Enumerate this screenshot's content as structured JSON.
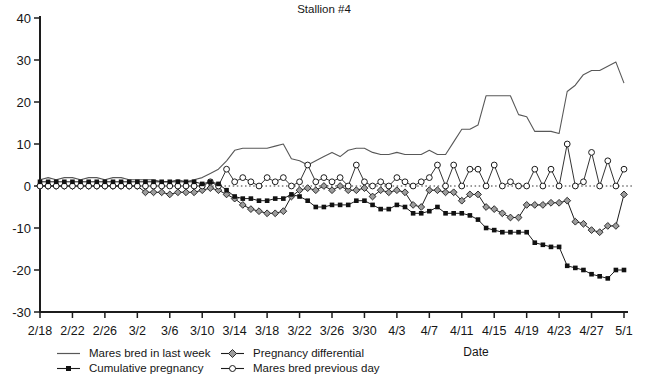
{
  "title": "Stallion #4",
  "axes": {
    "x_label": "Date",
    "y_ticks": [
      "40",
      "30",
      "20",
      "10",
      "0",
      "-10",
      "-20",
      "-30"
    ],
    "y_min": -30,
    "y_max": 40
  },
  "legend": [
    {
      "label": "Mares bred in last week",
      "marker": "line"
    },
    {
      "label": "Cumulative pregnancy",
      "marker": "square"
    },
    {
      "label": "Pregnancy differential",
      "marker": "diamond"
    },
    {
      "label": "Mares bred previous day",
      "marker": "circle"
    }
  ],
  "colors": {
    "axis": "#1c1c1c",
    "text": "#161616",
    "thin_line_series": "#585858",
    "marker_line": "#1c1c1c",
    "square_fill": "#111111",
    "diamond_fill": "#9c9c9c",
    "circle_fill": "#ffffff",
    "zero_line": "#333333",
    "background": "#ffffff"
  },
  "chart_data": {
    "type": "line",
    "title": "Stallion #4",
    "xlabel": "Date",
    "ylabel": "",
    "ylim": [
      -30,
      40
    ],
    "x_tick_every": 4,
    "grid": false,
    "zero_line": "dotted",
    "legend_position": "bottom",
    "x": [
      "2/18",
      "2/19",
      "2/20",
      "2/21",
      "2/22",
      "2/23",
      "2/24",
      "2/25",
      "2/26",
      "2/27",
      "2/28",
      "3/1",
      "3/2",
      "3/3",
      "3/4",
      "3/5",
      "3/6",
      "3/7",
      "3/8",
      "3/9",
      "3/10",
      "3/11",
      "3/12",
      "3/13",
      "3/14",
      "3/15",
      "3/16",
      "3/17",
      "3/18",
      "3/19",
      "3/20",
      "3/21",
      "3/22",
      "3/23",
      "3/24",
      "3/25",
      "3/26",
      "3/27",
      "3/28",
      "3/29",
      "3/30",
      "3/31",
      "4/1",
      "4/2",
      "4/3",
      "4/4",
      "4/5",
      "4/6",
      "4/7",
      "4/8",
      "4/9",
      "4/10",
      "4/11",
      "4/12",
      "4/13",
      "4/14",
      "4/15",
      "4/16",
      "4/17",
      "4/18",
      "4/19",
      "4/20",
      "4/21",
      "4/22",
      "4/23",
      "4/24",
      "4/25",
      "4/26",
      "4/27",
      "4/28",
      "4/29",
      "4/30",
      "5/1"
    ],
    "series": [
      {
        "name": "Mares bred in last week",
        "marker": "none",
        "values": [
          1.5,
          2,
          1.5,
          2,
          2,
          1.5,
          2,
          2,
          1.5,
          2,
          2,
          1.5,
          1.5,
          1.5,
          1.5,
          1,
          1,
          1.5,
          1,
          1.5,
          2,
          3,
          4,
          6,
          8.5,
          9,
          9,
          9,
          9,
          9.5,
          10,
          6.5,
          6,
          5,
          6,
          7,
          8,
          7,
          8.5,
          9,
          9,
          8,
          7.5,
          7.5,
          8,
          7.5,
          7.5,
          7.5,
          8.5,
          7.5,
          7.5,
          10.5,
          13.5,
          13.5,
          14.5,
          21.5,
          21.5,
          21.5,
          21.5,
          17,
          16.5,
          13,
          13,
          13,
          12.5,
          22.5,
          24,
          26.5,
          27.5,
          27.5,
          28.5,
          29.5,
          24.5
        ]
      },
      {
        "name": "Cumulative pregnancy",
        "marker": "square",
        "values": [
          1,
          1,
          1,
          1,
          1,
          1,
          1,
          1,
          1,
          1,
          1,
          1,
          1,
          1,
          1,
          1,
          1,
          1,
          1,
          1,
          0.5,
          1,
          0.5,
          -1,
          -2.5,
          -3,
          -3,
          -3.5,
          -3.5,
          -3,
          -3,
          -2,
          -2.5,
          -3.5,
          -5,
          -5,
          -4.5,
          -4.5,
          -4.5,
          -3.5,
          -3.5,
          -4.5,
          -5.5,
          -5.5,
          -4.5,
          -5,
          -6.5,
          -6.5,
          -6,
          -5,
          -6.5,
          -6.5,
          -6.5,
          -7,
          -8,
          -10,
          -10.5,
          -11,
          -11,
          -11,
          -11,
          -13.5,
          -14,
          -14.5,
          -14.5,
          -19,
          -19.5,
          -20,
          -21,
          -21.5,
          -22,
          -20,
          -20
        ]
      },
      {
        "name": "Pregnancy differential",
        "marker": "diamond",
        "values": [
          0,
          0,
          0,
          0,
          0,
          0,
          0,
          0,
          0,
          0,
          0,
          0,
          0,
          -1.5,
          -1.5,
          -1.5,
          -2,
          -1.5,
          -1.5,
          -1.5,
          -1,
          -0.5,
          -1,
          -2,
          -3,
          -4.5,
          -5.5,
          -6,
          -6.5,
          -6.5,
          -6,
          -2.5,
          -1,
          -0.5,
          -1,
          0,
          -1,
          0,
          -1,
          -1,
          -0.5,
          -2.5,
          -1,
          -1.5,
          -1,
          -1.5,
          -4.5,
          -5,
          -1,
          -1,
          -1.5,
          -1.5,
          -3.5,
          -2,
          -2,
          -5,
          -5.5,
          -6.5,
          -7.5,
          -7.5,
          -4.5,
          -4.5,
          -4.5,
          -4,
          -4,
          -3.5,
          -8.5,
          -9,
          -10.5,
          -11,
          -9.5,
          -9.5,
          -2
        ]
      },
      {
        "name": "Mares bred previous day",
        "marker": "circle",
        "values": [
          0,
          0,
          0,
          0,
          0,
          0,
          0,
          0,
          0,
          0,
          0,
          0,
          0,
          0,
          0,
          0,
          0,
          0,
          0,
          0,
          0,
          1,
          0,
          4,
          1,
          2,
          1,
          0,
          2,
          1,
          2,
          0,
          1,
          5,
          1,
          2,
          1,
          2,
          0,
          5,
          1,
          0,
          1,
          0,
          2,
          1,
          0,
          1,
          2,
          5,
          0,
          5,
          0,
          4,
          4,
          0,
          5,
          0,
          1,
          0,
          0,
          4,
          0,
          4,
          0,
          10,
          0,
          1,
          8,
          0,
          6,
          0,
          4
        ]
      }
    ]
  }
}
